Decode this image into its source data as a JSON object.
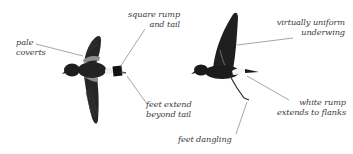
{
  "figure": {
    "colors": {
      "background": "#ffffff",
      "bird_dark": "#1c1c1c",
      "bird_mid": "#3a3a3a",
      "pale_covert": "#9a9a9a",
      "white_rump": "#f2f2f2",
      "leader_line": "#6a6a6a",
      "label_text": "#3a3a3a"
    },
    "birds": [
      {
        "id": "bird-left",
        "pose": "dorsal view, wings spread",
        "annotations": [
          {
            "id": "pale-coverts",
            "lines": [
              "pale",
              "coverts"
            ]
          },
          {
            "id": "square-rump-and-tail",
            "lines": [
              "square rump",
              "and tail"
            ]
          },
          {
            "id": "feet-extend-beyond-tail",
            "lines": [
              "feet extend",
              "beyond tail"
            ]
          }
        ]
      },
      {
        "id": "bird-right",
        "pose": "side view, wing raised",
        "annotations": [
          {
            "id": "virtually-uniform-underwing",
            "lines": [
              "virtually uniform",
              "underwing"
            ]
          },
          {
            "id": "white-rump-extends-to-flanks",
            "lines": [
              "white rump",
              "extends to flanks"
            ]
          },
          {
            "id": "feet-dangling",
            "lines": [
              "feet dangling"
            ]
          }
        ]
      }
    ]
  }
}
